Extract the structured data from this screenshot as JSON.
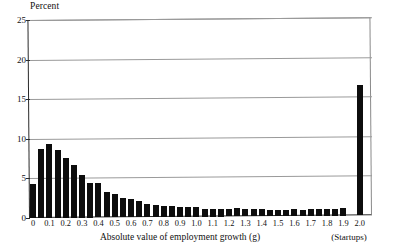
{
  "chart_data": {
    "type": "bar",
    "title": "",
    "ylabel": "Percent",
    "xlabel": "Absolute value of employment growth (g)",
    "ylim": [
      0,
      25
    ],
    "xlim": [
      -0.025,
      2.075
    ],
    "grid": true,
    "legend": null,
    "y_ticks": [
      0,
      5,
      10,
      15,
      20,
      25
    ],
    "y_tick_labels": [
      "0",
      "5",
      "10",
      "15",
      "20",
      "25"
    ],
    "x_ticks": [
      0,
      0.1,
      0.2,
      0.3,
      0.4,
      0.5,
      0.6,
      0.7,
      0.8,
      0.9,
      1.0,
      1.1,
      1.2,
      1.3,
      1.4,
      1.5,
      1.6,
      1.7,
      1.8,
      1.9,
      2.0
    ],
    "x_tick_labels": [
      "0",
      "0.1",
      "0.2",
      "0.3",
      "0.4",
      "0.5",
      "0.6",
      "0.7",
      "0.8",
      "0.9",
      "1.0",
      "1.1",
      "1.2",
      "1.3",
      "1.4",
      "1.5",
      "1.6",
      "1.7",
      "1.8",
      "1.9",
      "2.0"
    ],
    "bar_width": 0.05,
    "categories": [
      0,
      0.05,
      0.1,
      0.15,
      0.2,
      0.25,
      0.3,
      0.35,
      0.4,
      0.45,
      0.5,
      0.55,
      0.6,
      0.65,
      0.7,
      0.75,
      0.8,
      0.85,
      0.9,
      0.95,
      1.0,
      1.05,
      1.1,
      1.15,
      1.2,
      1.25,
      1.3,
      1.35,
      1.4,
      1.45,
      1.5,
      1.55,
      1.6,
      1.65,
      1.7,
      1.75,
      1.8,
      1.85,
      1.9,
      1.95,
      2.0
    ],
    "values": [
      4.3,
      8.7,
      9.3,
      8.6,
      7.5,
      6.6,
      5.4,
      4.4,
      4.3,
      3.2,
      3.0,
      2.5,
      2.3,
      2.1,
      1.7,
      1.5,
      1.4,
      1.4,
      1.3,
      1.2,
      1.2,
      1.0,
      0.9,
      0.9,
      0.9,
      1.1,
      0.9,
      0.9,
      0.9,
      0.8,
      0.8,
      0.8,
      0.9,
      0.8,
      0.8,
      0.8,
      0.8,
      0.8,
      0.9,
      0.0,
      16.5
    ],
    "annotations": [
      {
        "text": "(Startups)",
        "x": 2.0,
        "note": "label under the final bar"
      }
    ],
    "colors": {
      "bar": "#0d0d0d",
      "grid": "#9a9a9a",
      "axis": "#2a2a2a",
      "text": "#111111",
      "background": "#ffffff"
    }
  }
}
